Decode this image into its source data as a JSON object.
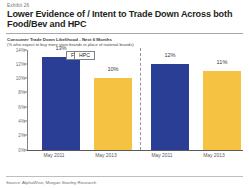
{
  "exhibit": {
    "label": "Exhibit 26",
    "title": "Lower Evidence of / Intent to Trade Down Across both Food/Bev and HPC"
  },
  "subtitle": {
    "line1": "Consumer Trade Down Likelihood - Next 6 Months",
    "line2": "(% who expect to buy more store brands in place of national brands)"
  },
  "source": {
    "text": "Source: AlphaWise, Morgan Stanley Research"
  },
  "colors": {
    "series_2011": "#2b3e96",
    "series_2013": "#f5c242",
    "axis": "#808285",
    "text": "#231f20"
  },
  "chart_data": {
    "type": "bar",
    "title": "Consumer Trade Down Likelihood - Next 6 Months",
    "subtitle": "(% who expect to buy more store brands in place of national brands)",
    "xlabel": "",
    "ylabel": "",
    "ylim": [
      0,
      14
    ],
    "ytick_labels": [
      "0%",
      "2%",
      "4%",
      "6%",
      "8%",
      "10%",
      "12%",
      "14%"
    ],
    "ytick_values": [
      0,
      2,
      4,
      6,
      8,
      10,
      12,
      14
    ],
    "grid": false,
    "legend": "none",
    "group_labels": [
      "Food",
      "HPC"
    ],
    "categories": [
      "May 2011",
      "May 2013"
    ],
    "series": [
      {
        "name": "Food",
        "values": [
          13,
          12
        ]
      },
      {
        "name": "HPC",
        "values": [
          10,
          11
        ]
      }
    ],
    "groups": [
      {
        "label": "Food",
        "bars": [
          {
            "category": "May 2011",
            "value": 13,
            "value_label": "13%",
            "color": "#2b3e96"
          },
          {
            "category": "May 2013",
            "value": 10,
            "value_label": "10%",
            "color": "#f5c242"
          }
        ]
      },
      {
        "label": "HPC",
        "bars": [
          {
            "category": "May 2011",
            "value": 12,
            "value_label": "12%",
            "color": "#2b3e96"
          },
          {
            "category": "May 2013",
            "value": 11,
            "value_label": "11%",
            "color": "#f5c242"
          }
        ]
      }
    ]
  }
}
